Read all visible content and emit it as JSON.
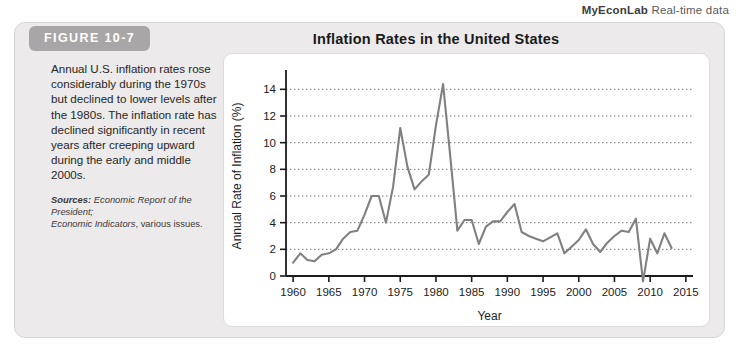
{
  "header": {
    "brand": "MyEconLab",
    "tagline": "Real-time data"
  },
  "figure": {
    "label": "FIGURE 10-7",
    "title": "Inflation Rates in the United States",
    "caption": "Annual U.S. inflation rates rose considerably during the 1970s but declined to lower levels after the 1980s. The inflation rate has declined significantly in recent years after creeping upward during the early and middle 2000s.",
    "sources_label": "Sources:",
    "sources_line1": "Economic Report of the President;",
    "sources_line2": "Economic Indicators",
    "sources_suffix": ", various issues."
  },
  "colors": {
    "line": "#808080",
    "axis": "#1c1c1c",
    "gridline": "#6e6e6e",
    "panel_bg": "#ffffff",
    "card_bg": "#eceaea",
    "tab_bg": "#a8a6a6"
  },
  "chart_data": {
    "type": "line",
    "title": "Inflation Rates in the United States",
    "xlabel": "Year",
    "ylabel": "Annual Rate of Inflation (%)",
    "xlim": [
      1959,
      2016
    ],
    "ylim": [
      0,
      15
    ],
    "xticks": [
      1960,
      1965,
      1970,
      1975,
      1980,
      1985,
      1990,
      1995,
      2000,
      2005,
      2010,
      2015
    ],
    "xtick_labels": [
      "1960",
      "1965",
      "1970",
      "1975",
      "1980",
      "1985",
      "1990",
      "1995",
      "2000",
      "2005",
      "2010",
      "2015"
    ],
    "yticks": [
      0,
      2,
      4,
      6,
      8,
      10,
      12,
      14
    ],
    "ytick_labels": [
      "0",
      "2",
      "4",
      "6",
      "8",
      "10",
      "12",
      "14"
    ],
    "grid": "horizontal-dotted",
    "legend": "none",
    "series": [
      {
        "name": "Annual Rate of Inflation",
        "x": [
          1960,
          1961,
          1962,
          1963,
          1964,
          1965,
          1966,
          1967,
          1968,
          1969,
          1970,
          1971,
          1972,
          1973,
          1974,
          1975,
          1976,
          1977,
          1978,
          1979,
          1980,
          1981,
          1982,
          1983,
          1984,
          1985,
          1986,
          1987,
          1988,
          1989,
          1990,
          1991,
          1992,
          1993,
          1994,
          1995,
          1996,
          1997,
          1998,
          1999,
          2000,
          2001,
          2002,
          2003,
          2004,
          2005,
          2006,
          2007,
          2008,
          2009,
          2010,
          2011,
          2012,
          2013
        ],
        "values": [
          1.0,
          1.7,
          1.2,
          1.1,
          1.6,
          1.7,
          2.0,
          2.8,
          3.3,
          3.4,
          4.6,
          6.0,
          6.0,
          4.0,
          6.7,
          11.1,
          8.2,
          6.5,
          7.1,
          7.6,
          11.3,
          14.4,
          9.0,
          3.4,
          4.2,
          4.2,
          2.4,
          3.7,
          4.1,
          4.1,
          4.8,
          5.4,
          3.3,
          3.0,
          2.8,
          2.6,
          2.9,
          3.2,
          1.7,
          2.2,
          2.7,
          3.5,
          2.4,
          1.8,
          2.5,
          3.0,
          3.4,
          3.3,
          4.3,
          -0.4,
          2.8,
          1.7,
          3.2,
          2.1
        ]
      }
    ]
  }
}
